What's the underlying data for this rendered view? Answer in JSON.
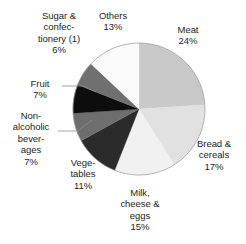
{
  "chart_data": {
    "type": "pie",
    "title": "",
    "subtitle": "",
    "xlabel": "",
    "ylabel": "",
    "legend_position": "none",
    "grid": false,
    "start_angle_deg": 0,
    "direction": "clockwise",
    "units": "percent",
    "total": 100,
    "categories": [
      "Meat",
      "Bread & cereals",
      "Milk, cheese & eggs",
      "Vegetables",
      "Non-alcoholic beverages",
      "Fruit",
      "Sugar & confectionery (1)",
      "Others"
    ],
    "values": [
      24,
      17,
      15,
      11,
      7,
      7,
      6,
      13
    ],
    "colors": [
      "#c9c9c9",
      "#e1e1e1",
      "#f1f1f1",
      "#2b2b2b",
      "#6e6e6e",
      "#0d0d0d",
      "#707070",
      "#fafafa"
    ],
    "slices": [
      {
        "label": "Meat",
        "value": 24,
        "value_text": "24%",
        "color": "#c9c9c9",
        "start_deg": 0.0,
        "end_deg": 86.4
      },
      {
        "label": "Bread & cereals",
        "value": 17,
        "value_text": "17%",
        "color": "#e1e1e1",
        "start_deg": 86.4,
        "end_deg": 147.6
      },
      {
        "label": "Milk, cheese & eggs",
        "value": 15,
        "value_text": "15%",
        "color": "#f1f1f1",
        "start_deg": 147.6,
        "end_deg": 201.6
      },
      {
        "label": "Vegetables",
        "value": 11,
        "value_text": "11%",
        "color": "#2b2b2b",
        "start_deg": 201.6,
        "end_deg": 241.2
      },
      {
        "label": "Non-alcoholic beverages",
        "value": 7,
        "value_text": "7%",
        "color": "#6e6e6e",
        "start_deg": 241.2,
        "end_deg": 266.4
      },
      {
        "label": "Fruit",
        "value": 7,
        "value_text": "7%",
        "color": "#0d0d0d",
        "start_deg": 266.4,
        "end_deg": 291.6
      },
      {
        "label": "Sugar & confectionery (1)",
        "value": 6,
        "value_text": "6%",
        "color": "#707070",
        "start_deg": 291.6,
        "end_deg": 313.2
      },
      {
        "label": "Others",
        "value": 13,
        "value_text": "13%",
        "color": "#fafafa",
        "start_deg": 313.2,
        "end_deg": 360.0
      }
    ]
  },
  "labels": {
    "meat": "Meat\n24%",
    "bread": "Bread &\ncereals\n17%",
    "milk": "Milk,\ncheese &\neggs\n15%",
    "vegetables": "Vege-\ntables\n11%",
    "nonalcoholic": "Non-\nalcoholic\nbever-\nages\n7%",
    "fruit": "Fruit\n7%",
    "sugar": "Sugar &\nconfec-\ntionery (1)\n6%",
    "others": "Others\n13%"
  },
  "geometry": {
    "center_x": 139,
    "center_y": 109,
    "radius": 66,
    "outline_color": "#9a9a9a",
    "leader_color": "#8a8a8a"
  }
}
